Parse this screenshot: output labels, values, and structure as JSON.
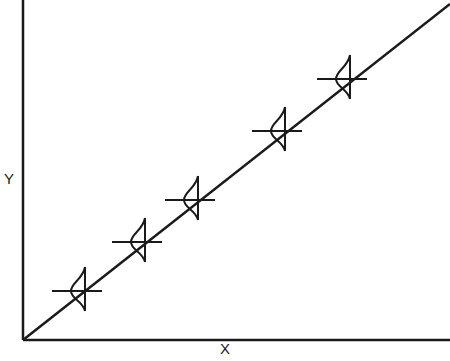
{
  "chart_data": {
    "type": "line",
    "title": "",
    "xlabel": "X",
    "ylabel": "Y",
    "axis_ticks": "none",
    "grid": false,
    "regression_line": {
      "from": [
        23,
        340
      ],
      "to": [
        450,
        4
      ]
    },
    "distribution_markers": [
      {
        "x": 80,
        "y": 291
      },
      {
        "x": 140,
        "y": 242
      },
      {
        "x": 193,
        "y": 200
      },
      {
        "x": 280,
        "y": 131
      },
      {
        "x": 345,
        "y": 79
      }
    ]
  },
  "labels": {
    "x": "X",
    "y": "Y"
  },
  "colors": {
    "ink": "#1a1a1a",
    "background": "#ffffff"
  }
}
